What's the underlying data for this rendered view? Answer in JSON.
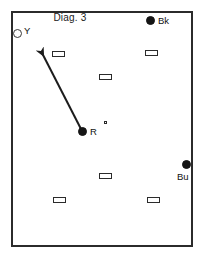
{
  "diagram": {
    "title": "Diag. 3",
    "frame": {
      "x": 11,
      "y": 11,
      "width": 182,
      "height": 236,
      "border_color": "#2b2b2b"
    },
    "background_color": "#ffffff"
  },
  "players": [
    {
      "id": "yellow",
      "label": "Y",
      "marker": "hollow-circle",
      "color": "#ffffff",
      "outline_color": "#3a3a3a",
      "x": 18,
      "y": 34,
      "label_x": 25,
      "label_y": 27
    },
    {
      "id": "black",
      "label": "Bk",
      "marker": "filled-circle",
      "color": "#151515",
      "outline_color": "#151515",
      "x": 150,
      "y": 20,
      "label_x": 157,
      "label_y": 15
    },
    {
      "id": "red",
      "label": "R",
      "marker": "filled-circle",
      "color": "#151515",
      "outline_color": "#151515",
      "x": 83,
      "y": 131,
      "label_x": 90,
      "label_y": 126
    },
    {
      "id": "blue",
      "label": "Bu",
      "marker": "filled-circle",
      "color": "#151515",
      "outline_color": "#151515",
      "x": 186,
      "y": 164,
      "label_x": 177,
      "label_y": 170
    }
  ],
  "degree_mark": {
    "x": 104,
    "y": 121
  },
  "cones": [
    {
      "x": 52,
      "y": 51
    },
    {
      "x": 145,
      "y": 50
    },
    {
      "x": 99,
      "y": 74
    },
    {
      "x": 99,
      "y": 173
    },
    {
      "x": 53,
      "y": 197
    },
    {
      "x": 147,
      "y": 197
    }
  ],
  "arrow": {
    "from_x": 81,
    "from_y": 129,
    "to_x": 38,
    "to_y": 46,
    "color": "#1c1c1c",
    "width": 2
  }
}
